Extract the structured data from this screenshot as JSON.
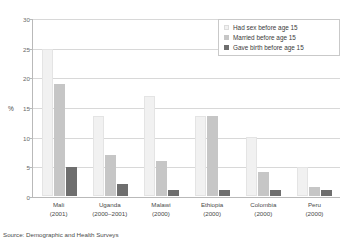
{
  "title": "",
  "axis": {
    "y_label": "%",
    "y_ticks": [
      "0",
      "5",
      "10",
      "15",
      "20",
      "25",
      "30"
    ]
  },
  "legend": {
    "items": [
      {
        "label": "Had sex before age 15",
        "color": "#f1f1f1"
      },
      {
        "label": "Married before age 15",
        "color": "#c6c6c6"
      },
      {
        "label": "Gave birth before age 15",
        "color": "#6e6e6e"
      }
    ]
  },
  "categories": [
    {
      "name": "Mali",
      "year": "(2001)"
    },
    {
      "name": "Uganda",
      "year": "(2000–2001)"
    },
    {
      "name": "Malawi",
      "year": "(2000)"
    },
    {
      "name": "Ethiopia",
      "year": "(2000)"
    },
    {
      "name": "Colombia",
      "year": "(2000)"
    },
    {
      "name": "Peru",
      "year": "(2000)"
    }
  ],
  "source": "Source: Demographic and Health Surveys",
  "chart_data": {
    "type": "bar",
    "title": "",
    "xlabel": "",
    "ylabel": "%",
    "ylim": [
      0,
      30
    ],
    "ytick_step": 5,
    "grid": true,
    "legend_position": "top-right",
    "categories": [
      "Mali (2001)",
      "Uganda (2000–2001)",
      "Malawi (2000)",
      "Ethiopia (2000)",
      "Colombia (2000)",
      "Peru (2000)"
    ],
    "series": [
      {
        "name": "Had sex before age 15",
        "color": "#f1f1f1",
        "values": [
          25.0,
          13.5,
          17.0,
          13.5,
          10.0,
          5.0
        ]
      },
      {
        "name": "Married before age 15",
        "color": "#c6c6c6",
        "values": [
          19.0,
          7.0,
          6.0,
          13.5,
          4.0,
          1.5
        ]
      },
      {
        "name": "Gave birth before age 15",
        "color": "#6e6e6e",
        "values": [
          5.0,
          2.0,
          1.0,
          1.0,
          1.0,
          1.0
        ]
      }
    ]
  }
}
